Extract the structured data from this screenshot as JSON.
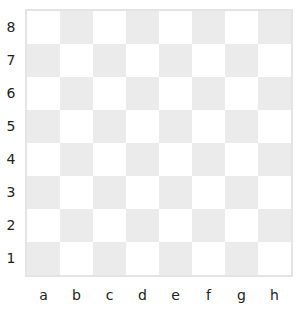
{
  "board": {
    "ranks": [
      "8",
      "7",
      "6",
      "5",
      "4",
      "3",
      "2",
      "1"
    ],
    "files": [
      "a",
      "b",
      "c",
      "d",
      "e",
      "f",
      "g",
      "h"
    ],
    "colors": {
      "light": "#ffffff",
      "dark": "#ebebeb",
      "border": "#e4e4e4"
    },
    "pieces": []
  }
}
